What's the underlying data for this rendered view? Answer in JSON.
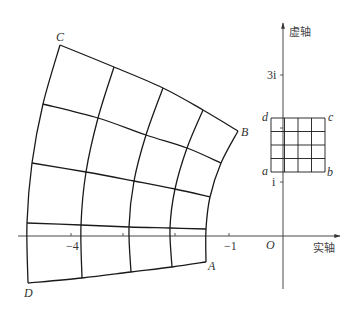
{
  "figure": {
    "colors": {
      "stroke": "#1a1a1a",
      "axis": "#333333",
      "text": "#333333"
    }
  },
  "axes": {
    "real_label": "实轴",
    "imag_label": "虚轴",
    "origin_label": "O",
    "real_ticks": [
      {
        "value": -4,
        "label": "−4",
        "x": 71
      },
      {
        "value": -3,
        "label": "",
        "x": 123
      },
      {
        "value": -2,
        "label": "",
        "x": 175
      },
      {
        "value": -1,
        "label": "−1",
        "x": 229
      }
    ],
    "imag_ticks": [
      {
        "value": 1,
        "label": "i",
        "y": 182
      },
      {
        "value": 2,
        "label": "",
        "y": 128
      },
      {
        "value": 3,
        "label": "3i",
        "y": 75
      }
    ],
    "origin": {
      "x": 283,
      "y": 236
    },
    "x_range_px": [
      18,
      340
    ],
    "y_range_px": [
      23,
      289
    ]
  },
  "small_square": {
    "corner_labels": {
      "a": "a",
      "b": "b",
      "c": "c",
      "d": "d"
    },
    "left": 271,
    "right": 325,
    "top": 118,
    "bottom": 172,
    "divisions": 4
  },
  "mapped_grid": {
    "corner_labels": {
      "A": "A",
      "B": "B",
      "C": "C",
      "D": "D"
    },
    "columns": [
      [
        [
          60,
          45
        ],
        [
          43,
          104
        ],
        [
          32,
          163
        ],
        [
          27,
          223
        ],
        [
          28,
          283
        ]
      ],
      [
        [
          114,
          67
        ],
        [
          98,
          118
        ],
        [
          86,
          172
        ],
        [
          81,
          225
        ],
        [
          82,
          278
        ]
      ],
      [
        [
          163,
          88
        ],
        [
          146,
          135
        ],
        [
          134,
          181
        ],
        [
          129,
          227
        ],
        [
          131,
          272
        ]
      ],
      [
        [
          203,
          110
        ],
        [
          187,
          148
        ],
        [
          175,
          189
        ],
        [
          170,
          228
        ],
        [
          172,
          267
        ]
      ],
      [
        [
          238,
          131
        ],
        [
          221,
          163
        ],
        [
          210,
          197
        ],
        [
          206,
          229
        ],
        [
          206,
          262
        ]
      ]
    ]
  }
}
